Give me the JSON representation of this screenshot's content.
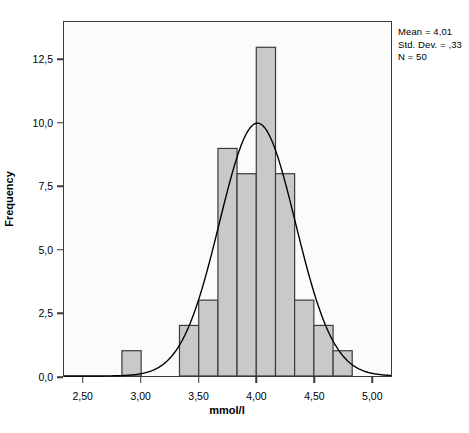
{
  "chart_data": {
    "type": "bar",
    "title": "",
    "xlabel": "mmol/l",
    "ylabel": "Frequency",
    "xlim": [
      2.33,
      5.17
    ],
    "ylim": [
      0,
      14.0
    ],
    "grid": false,
    "bin_width": 0.1667,
    "x_tick_labels": [
      "2,50",
      "3,00",
      "3,50",
      "4,00",
      "4,50",
      "5,00"
    ],
    "x_tick_values": [
      2.5,
      3.0,
      3.5,
      4.0,
      4.5,
      5.0
    ],
    "y_tick_labels": [
      "0,0",
      "2,5",
      "5,0",
      "7,5",
      "10,0",
      "12,5"
    ],
    "y_tick_values": [
      0,
      2.5,
      5.0,
      7.5,
      10.0,
      12.5
    ],
    "bars": [
      {
        "bin_start": 2.833,
        "bin_end": 3.0,
        "center": 2.917,
        "value": 1
      },
      {
        "bin_start": 3.333,
        "bin_end": 3.5,
        "center": 3.417,
        "value": 2
      },
      {
        "bin_start": 3.5,
        "bin_end": 3.667,
        "center": 3.583,
        "value": 3
      },
      {
        "bin_start": 3.667,
        "bin_end": 3.833,
        "center": 3.75,
        "value": 9
      },
      {
        "bin_start": 3.833,
        "bin_end": 4.0,
        "center": 3.917,
        "value": 8
      },
      {
        "bin_start": 4.0,
        "bin_end": 4.167,
        "center": 4.083,
        "value": 13
      },
      {
        "bin_start": 4.167,
        "bin_end": 4.333,
        "center": 4.25,
        "value": 8
      },
      {
        "bin_start": 4.333,
        "bin_end": 4.5,
        "center": 4.417,
        "value": 3
      },
      {
        "bin_start": 4.5,
        "bin_end": 4.667,
        "center": 4.583,
        "value": 2
      },
      {
        "bin_start": 4.667,
        "bin_end": 4.833,
        "center": 4.75,
        "value": 1
      }
    ],
    "normal_curve": {
      "mean": 4.01,
      "std_dev": 0.33,
      "n": 50,
      "peak_value": 10.0,
      "visible": true
    },
    "bar_fill_color": "#c9c9c9",
    "bar_border_color": "#3a3a3a",
    "curve_color": "#000000",
    "frame_color": "#3a3a3a"
  },
  "annotations": {
    "mean_line": "Mean = 4,01",
    "std_line": "Std. Dev. = ,33",
    "n_line": "N = 50"
  }
}
